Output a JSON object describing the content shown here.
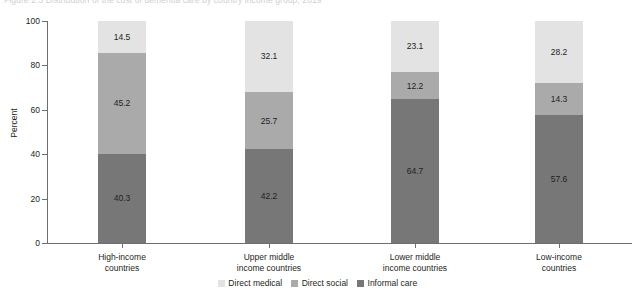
{
  "figure": {
    "cut_off_caption": "Figure 2.3  Distribution of the cost of dementia care by country income group, 2019"
  },
  "axes": {
    "ylabel": "Percent",
    "yticks": [
      "0",
      "20",
      "40",
      "60",
      "80",
      "100"
    ]
  },
  "legend": {
    "items": [
      {
        "label": "Direct medical",
        "color": "#e3e3e3"
      },
      {
        "label": "Direct social",
        "color": "#aaaaaa"
      },
      {
        "label": "Informal care",
        "color": "#777777"
      }
    ]
  },
  "categories": [
    {
      "line1": "High-income",
      "line2": "countries"
    },
    {
      "line1": "Upper middle",
      "line2": "income countries"
    },
    {
      "line1": "Lower middle",
      "line2": "income countries"
    },
    {
      "line1": "Low-income",
      "line2": "countries"
    }
  ],
  "bars": [
    {
      "informal": "40.3",
      "social": "45.2",
      "medical": "14.5"
    },
    {
      "informal": "42.2",
      "social": "25.7",
      "medical": "32.1"
    },
    {
      "informal": "64.7",
      "social": "12.2",
      "medical": "23.1"
    },
    {
      "informal": "57.6",
      "social": "14.3",
      "medical": "28.2"
    }
  ],
  "chart_data": {
    "type": "bar",
    "subtype": "stacked-100-percent",
    "title": "",
    "xlabel": "",
    "ylabel": "Percent",
    "ylim": [
      0,
      100
    ],
    "yticks": [
      0,
      20,
      40,
      60,
      80,
      100
    ],
    "grid": false,
    "legend_position": "bottom-center",
    "categories": [
      "High-income countries",
      "Upper middle income countries",
      "Lower middle income countries",
      "Low-income countries"
    ],
    "series": [
      {
        "name": "Informal care",
        "color": "#777777",
        "values": [
          40.3,
          42.2,
          64.7,
          57.6
        ]
      },
      {
        "name": "Direct social",
        "color": "#aaaaaa",
        "values": [
          45.2,
          25.7,
          12.2,
          14.3
        ]
      },
      {
        "name": "Direct medical",
        "color": "#e3e3e3",
        "values": [
          14.5,
          32.1,
          23.1,
          28.2
        ]
      }
    ],
    "stack_order_bottom_to_top": [
      "Informal care",
      "Direct social",
      "Direct medical"
    ],
    "data_labels": true
  }
}
